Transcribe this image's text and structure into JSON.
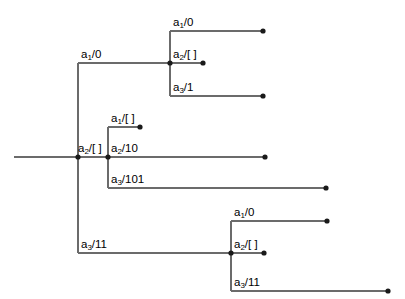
{
  "figure": {
    "type": "tree-diagram",
    "width": 405,
    "height": 299,
    "background_color": "#ffffff",
    "line_color": "#6b6b6b",
    "node_color": "#1a1a1a",
    "text_color": "#000000"
  },
  "root": {
    "stem_label": ""
  },
  "clades": {
    "top": {
      "branch_label_prefix": "a",
      "branch_label_sub": "1",
      "branch_label_value": "/0",
      "children": [
        {
          "prefix": "a",
          "sub": "1",
          "value": "/0"
        },
        {
          "prefix": "a",
          "sub": "2",
          "value": "/[ ]"
        },
        {
          "prefix": "a",
          "sub": "3",
          "value": "/1"
        }
      ]
    },
    "middle": {
      "branch_label_prefix": "a",
      "branch_label_sub": "2",
      "branch_label_value": "/[ ]",
      "children": [
        {
          "prefix": "a",
          "sub": "1",
          "value": "/[ ]"
        },
        {
          "prefix": "a",
          "sub": "2",
          "value": "/10"
        },
        {
          "prefix": "a",
          "sub": "3",
          "value": "/101"
        }
      ]
    },
    "bottom": {
      "branch_label_prefix": "a",
      "branch_label_sub": "3",
      "branch_label_value": "/11",
      "children": [
        {
          "prefix": "a",
          "sub": "1",
          "value": "/0"
        },
        {
          "prefix": "a",
          "sub": "2",
          "value": "/[ ]"
        },
        {
          "prefix": "a",
          "sub": "3",
          "value": "/11"
        }
      ]
    }
  }
}
